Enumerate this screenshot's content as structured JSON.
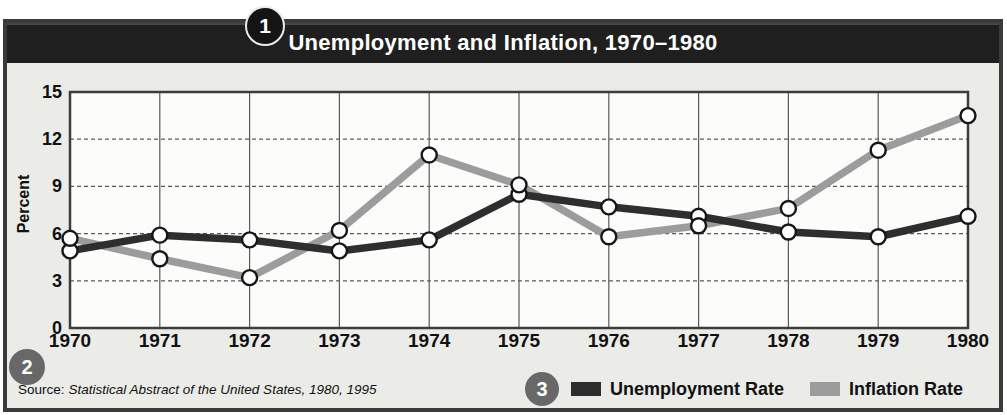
{
  "badges": [
    "1",
    "2",
    "3"
  ],
  "header": {
    "title": "Unemployment and Inflation, 1970–1980"
  },
  "chart_data": {
    "type": "line",
    "title": "Unemployment and Inflation, 1970–1980",
    "xlabel": "",
    "ylabel": "Percent",
    "ylim": [
      0,
      15
    ],
    "yticks": [
      0,
      3,
      6,
      9,
      12,
      15
    ],
    "grid": true,
    "legend_position": "bottom-right",
    "marker": "white-circle",
    "categories": [
      "1970",
      "1971",
      "1972",
      "1973",
      "1974",
      "1975",
      "1976",
      "1977",
      "1978",
      "1979",
      "1980"
    ],
    "series": [
      {
        "name": "Unemployment Rate",
        "color": "#2e2e2e",
        "values": [
          4.9,
          5.9,
          5.6,
          4.9,
          5.6,
          8.5,
          7.7,
          7.1,
          6.1,
          5.8,
          7.1
        ]
      },
      {
        "name": "Inflation Rate",
        "color": "#9c9c9c",
        "values": [
          5.7,
          4.4,
          3.2,
          6.2,
          11.0,
          9.1,
          5.8,
          6.5,
          7.6,
          11.3,
          13.5
        ]
      }
    ]
  },
  "footer": {
    "source_label": "Source:",
    "source_text": "Statistical Abstract of the United States, 1980, 1995"
  },
  "colors": {
    "header_bg": "#1f1f1f",
    "panel_bg": "#ebebe8",
    "plot_bg": "#fcfcfa",
    "grid": "#5a5a5a",
    "plot_border": "#3d3d3d",
    "badge_gray": "#686868",
    "badge_black": "#141414"
  }
}
